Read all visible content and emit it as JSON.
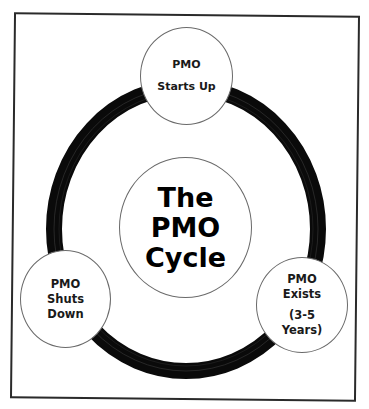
{
  "diagram": {
    "type": "cycle",
    "colors": {
      "ring": "#0a0a0a",
      "frame": "#2a2a2a",
      "node_fill": "#ffffff",
      "node_border": "#6a6a6a",
      "text": "#1a1a1a"
    },
    "center": {
      "lines": [
        "The",
        "PMO",
        "Cycle"
      ]
    },
    "nodes": [
      {
        "id": "starts-up",
        "lines": [
          "PMO",
          "Starts Up"
        ]
      },
      {
        "id": "exists",
        "lines": [
          "PMO",
          "Exists",
          "(3-5",
          "Years)"
        ]
      },
      {
        "id": "shuts-down",
        "lines": [
          "PMO",
          "Shuts",
          "Down"
        ]
      }
    ]
  }
}
